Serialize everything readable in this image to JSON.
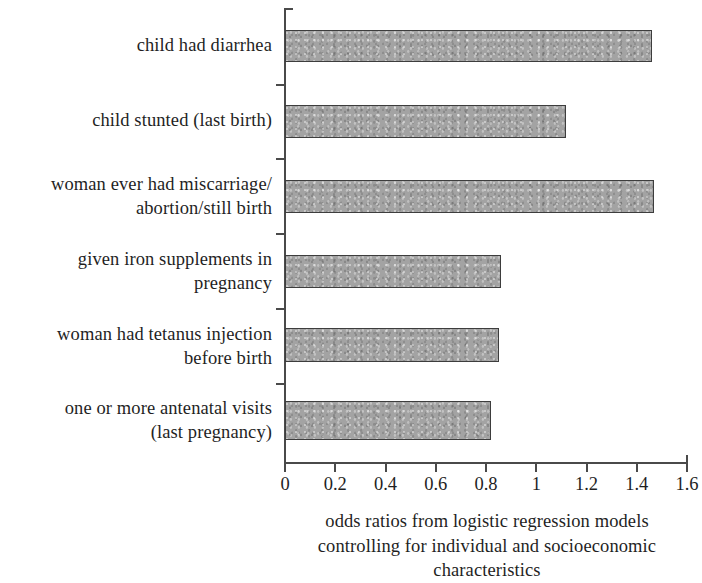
{
  "chart_data": {
    "type": "bar",
    "orientation": "horizontal",
    "title": "",
    "subtitle": "",
    "xlabel_lines": [
      "odds ratios from logistic regression models",
      "controlling for individual and socioeconomic",
      "characteristics"
    ],
    "xlabel": "odds ratios from logistic regression models controlling for individual and socioeconomic characteristics",
    "ylabel": "",
    "xlim": [
      0,
      1.6
    ],
    "ylim": null,
    "grid": false,
    "legend": null,
    "xticks": [
      "0",
      "0.2",
      "0.4",
      "0.6",
      "0.8",
      "1",
      "1.2",
      "1.4",
      "1.6"
    ],
    "xtick_values": [
      0,
      0.2,
      0.4,
      0.6,
      0.8,
      1,
      1.2,
      1.4,
      1.6
    ],
    "categories": [
      "child had diarrhea",
      "child stunted (last birth)",
      "woman ever had miscarriage/abortion/still birth",
      "given iron supplements in pregnancy",
      "woman had tetanus injection before birth",
      "one or more antenatal visits (last pregnancy)"
    ],
    "category_lines": [
      [
        "child had diarrhea"
      ],
      [
        "child stunted (last birth)"
      ],
      [
        "woman ever had miscarriage/",
        "abortion/still birth"
      ],
      [
        "given iron supplements in",
        "pregnancy"
      ],
      [
        "woman had tetanus injection",
        "before birth"
      ],
      [
        "one or more antenatal visits",
        "(last pregnancy)"
      ]
    ],
    "values": [
      1.46,
      1.12,
      1.47,
      0.86,
      0.85,
      0.82
    ],
    "bar_color": "#a3a3a3",
    "bar_edge_color": "#3d3d3d",
    "axis_color": "#4a4a4a",
    "background_color": "#ffffff"
  },
  "geometry": {
    "x0_px": 285,
    "x_unit_px": 251.25,
    "bars": [
      {
        "top": 30,
        "height": 32
      },
      {
        "top": 105,
        "height": 33
      },
      {
        "top": 180,
        "height": 33
      },
      {
        "top": 255,
        "height": 33
      },
      {
        "top": 328,
        "height": 34
      },
      {
        "top": 401,
        "height": 39
      }
    ],
    "y_ticks": [
      84,
      158,
      233,
      308,
      383
    ],
    "labels": [
      {
        "top": 33
      },
      {
        "top": 108
      },
      {
        "top": 172
      },
      {
        "top": 247
      },
      {
        "top": 322
      },
      {
        "top": 396
      }
    ]
  }
}
